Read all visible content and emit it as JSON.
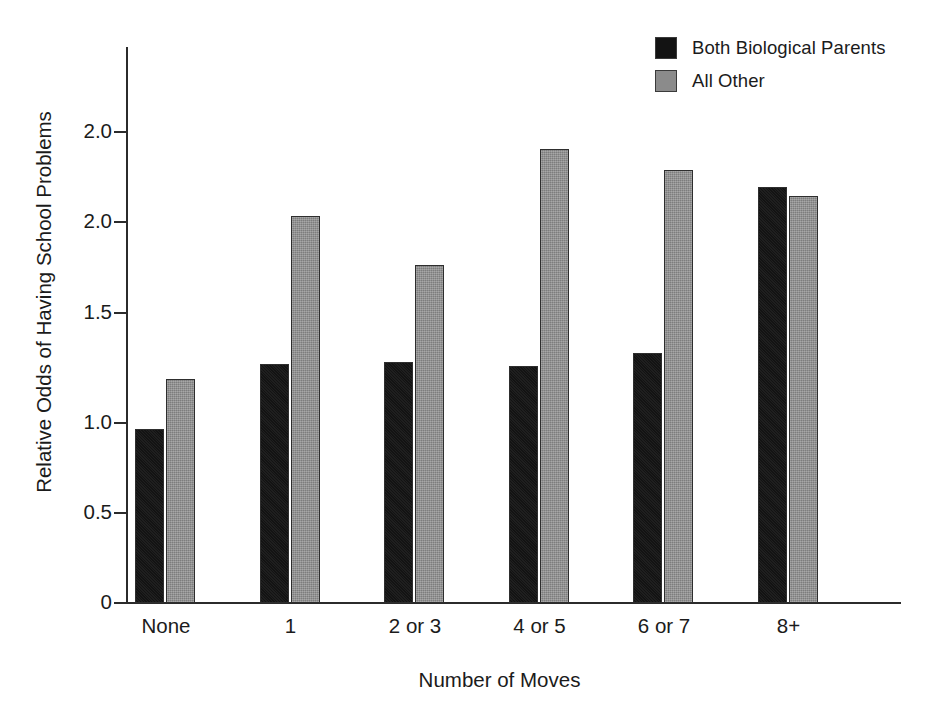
{
  "chart_data": {
    "type": "bar",
    "title": "",
    "subtitle": "",
    "xlabel": "Number of Moves",
    "ylabel": "Relative Odds of Having School Problems",
    "categories": [
      "None",
      "1",
      "2 or 3",
      "4 or 5",
      "6 or 7",
      "8+"
    ],
    "series": [
      {
        "name": "Both Biological Parents",
        "color": "#131313",
        "values": [
          0.96,
          1.32,
          1.33,
          1.31,
          1.38,
          2.3
        ]
      },
      {
        "name": "All Other",
        "color": "#8b8b8b",
        "values": [
          1.24,
          2.14,
          1.87,
          2.51,
          2.39,
          2.25
        ]
      }
    ],
    "ytick_labels": [
      "2.0",
      "2.0",
      "1.5",
      "1.0",
      "0.5",
      "0"
    ],
    "ytick_values": [
      2.5,
      2.0,
      1.5,
      1.0,
      0.5,
      0.0
    ],
    "ylim": [
      0,
      2.7
    ],
    "grid": false,
    "legend_position": "top-right"
  },
  "legend": {
    "entries": [
      {
        "label": "Both Biological Parents",
        "swatch": "#131313"
      },
      {
        "label": "All Other",
        "swatch": "#8b8b8b"
      }
    ]
  },
  "axis": {
    "x_title": "Number of Moves",
    "y_title": "Relative Odds of Having School Problems"
  }
}
